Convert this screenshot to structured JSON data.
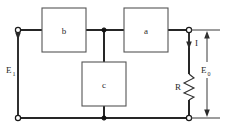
{
  "diagram": {
    "type": "circuit-schematic",
    "canvas": {
      "width": 228,
      "height": 135
    },
    "colors": {
      "background": "#ffffff",
      "wire": "#262626",
      "box_outline": "#555555",
      "label_text": "#2a2a2a"
    },
    "blocks": [
      {
        "id": "b",
        "label": "b",
        "x": 42,
        "y": 8,
        "width": 44,
        "height": 44
      },
      {
        "id": "a",
        "label": "a",
        "x": 124,
        "y": 8,
        "width": 44,
        "height": 44
      },
      {
        "id": "c",
        "label": "c",
        "x": 82,
        "y": 62,
        "width": 44,
        "height": 44
      }
    ],
    "components": [
      {
        "id": "R",
        "label": "R",
        "type": "resistor",
        "orientation": "vertical"
      }
    ],
    "annotations": [
      {
        "id": "E1",
        "base": "E",
        "subscript": "1",
        "text": "E₁",
        "meaning": "input-voltage"
      },
      {
        "id": "E0",
        "base": "E",
        "subscript": "0",
        "text": "E₀",
        "meaning": "output-voltage"
      },
      {
        "id": "I",
        "base": "I",
        "subscript": "",
        "text": "I",
        "meaning": "current"
      }
    ],
    "terminals": [
      {
        "id": "input-top",
        "style": "open"
      },
      {
        "id": "input-bottom",
        "style": "open"
      },
      {
        "id": "output-top",
        "style": "open"
      },
      {
        "id": "output-bottom",
        "style": "open"
      }
    ],
    "junctions": [
      {
        "id": "top-node",
        "style": "filled"
      },
      {
        "id": "bottom-node",
        "style": "filled"
      }
    ]
  }
}
